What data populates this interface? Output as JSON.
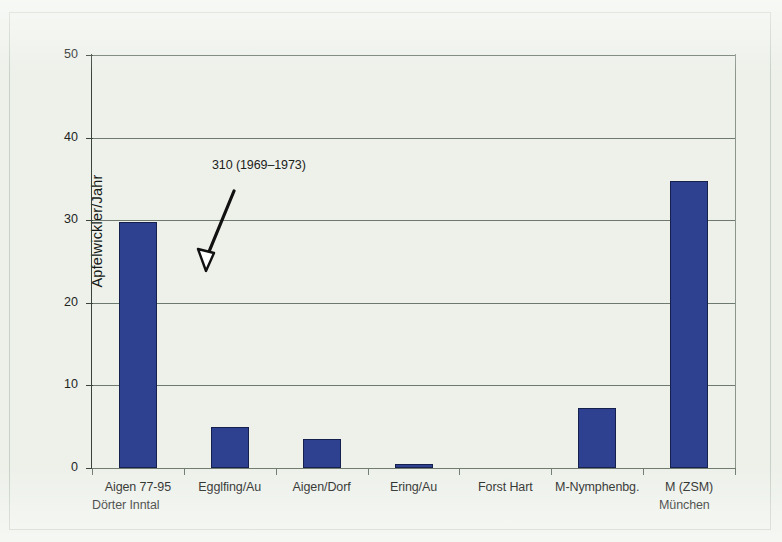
{
  "chart_data": {
    "type": "bar",
    "title": "",
    "xlabel": "",
    "ylabel": "Apfelwickler/Jahr",
    "categories": [
      "Aigen 77-95",
      "Egglfing/Au",
      "Aigen/Dorf",
      "Ering/Au",
      "Forst Hart",
      "M-Nymphenbg.",
      "M (ZSM)"
    ],
    "values": [
      29.8,
      5.0,
      3.5,
      0.5,
      0,
      7.3,
      34.7
    ],
    "ylim": [
      0,
      50
    ],
    "yticks": [
      0,
      10,
      20,
      30,
      40,
      50
    ],
    "ytick_labels": [
      "0",
      "10",
      "20",
      "30",
      "40",
      "50"
    ],
    "grid": true,
    "legend": "none",
    "annotations": [
      {
        "text": "310 (1969–1973)",
        "points_to_category": "Aigen 77-95",
        "arrow": true
      }
    ],
    "group_labels": [
      {
        "text": "Dörter Inntal",
        "align": "left"
      },
      {
        "text": "München",
        "align": "right"
      }
    ],
    "colors": {
      "bar_fill": "#2e4090",
      "bar_edge": "#16204c",
      "background": "#edf1ea",
      "grid": "#6f7a6e",
      "axis": "#3a433a",
      "text": "#1b211b"
    }
  }
}
